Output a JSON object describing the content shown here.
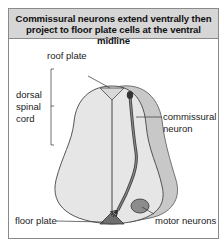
{
  "figure": {
    "title_line1": "Commissural neurons extend ventrally then",
    "title_line2": "project to floor plate cells at the ventral midline",
    "labels": {
      "roof_plate": "roof plate",
      "dorsal_line1": "dorsal",
      "dorsal_line2": "spinal",
      "dorsal_line3": "cord",
      "commissural_line1": "commissural",
      "commissural_line2": "neuron",
      "floor_plate": "floor plate",
      "motor_neurons": "motor neurons"
    },
    "colors": {
      "header_bg": "#d6d6d6",
      "cord_fill": "#e6e6e6",
      "outer_band": "#c8c8c8",
      "neuron": "#555555",
      "motor_neurons": "#8c8c8c",
      "floor_plate": "#6e6e6e"
    }
  }
}
